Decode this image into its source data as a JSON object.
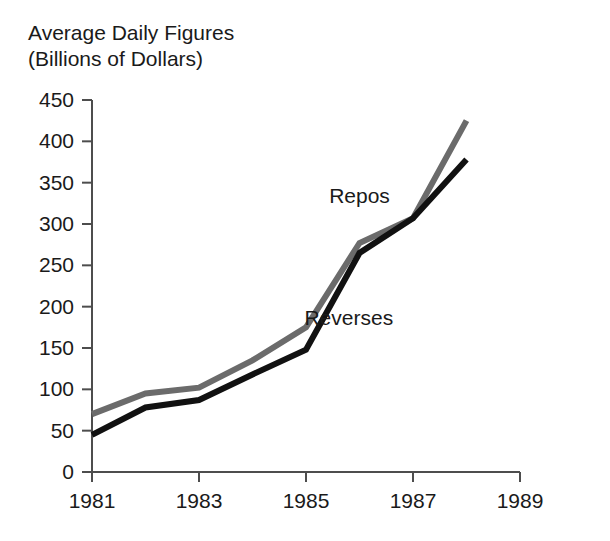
{
  "chart_data": {
    "type": "line",
    "title": "Average Daily Figures",
    "subtitle": "(Billions of Dollars)",
    "xlabel": "",
    "ylabel": "",
    "xlim": [
      1981,
      1989
    ],
    "ylim": [
      0,
      450
    ],
    "x_ticks": [
      1981,
      1983,
      1985,
      1987,
      1989
    ],
    "x_tick_labels": [
      "1981",
      "1983",
      "1985",
      "1987",
      "1989"
    ],
    "y_ticks": [
      0,
      50,
      100,
      150,
      200,
      250,
      300,
      350,
      400,
      450
    ],
    "y_tick_labels": [
      "0",
      "50",
      "100",
      "150",
      "200",
      "250",
      "300",
      "350",
      "400",
      "450"
    ],
    "grid": false,
    "legend_position": "inline-annotation",
    "x": [
      1981,
      1982,
      1983,
      1984,
      1985,
      1986,
      1987,
      1988
    ],
    "series": [
      {
        "name": "Repos",
        "color": "#6b6b6b",
        "stroke_width": 6,
        "values": [
          70,
          95,
          102,
          135,
          175,
          277,
          307,
          425
        ],
        "label_x": 1986.0,
        "label_y": 325
      },
      {
        "name": "Reverses",
        "color": "#111111",
        "stroke_width": 6,
        "values": [
          45,
          78,
          87,
          118,
          148,
          265,
          307,
          378
        ],
        "label_x": 1985.8,
        "label_y": 178
      }
    ],
    "annotations": [
      {
        "text": "Repos",
        "x": 1986.0,
        "y": 325
      },
      {
        "text": "Reverses",
        "x": 1985.8,
        "y": 178
      }
    ],
    "axis_color": "#4d4d4d"
  }
}
